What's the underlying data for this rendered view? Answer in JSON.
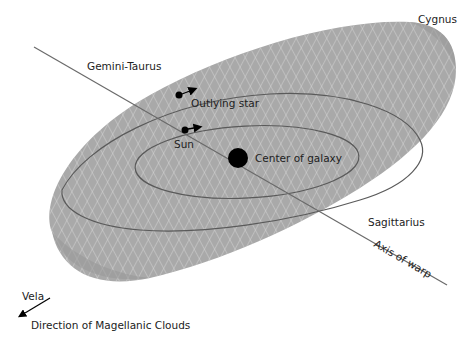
{
  "diagram": {
    "type": "warped galactic disc schematic",
    "colors": {
      "disc_fill": "#a9a9a9",
      "grid_lines": "#d6d6d6",
      "orbit_lines": "#5a5a5a",
      "axis_line": "#6a6a6a",
      "markers": "#000000",
      "text": "#222222"
    },
    "labels": {
      "cygnus": "Cygnus",
      "gemini_taurus": "Gemini-Taurus",
      "outlying_star": "Outlying star",
      "sun": "Sun",
      "center_of_galaxy": "Center of galaxy",
      "sagittarius": "Sagittarius",
      "axis_of_warp": "Axis of warp",
      "vela": "Vela",
      "direction_magellanic": "Direction of Magellanic Clouds"
    },
    "elements": [
      {
        "id": "galactic-disc",
        "shape": "warped ellipse"
      },
      {
        "id": "inner-orbit",
        "passes_through": "Sun"
      },
      {
        "id": "outer-orbit",
        "passes_through": "Outlying star"
      },
      {
        "id": "center-of-galaxy",
        "marker": "large filled circle"
      },
      {
        "id": "sun",
        "marker": "small filled circle with motion arrow"
      },
      {
        "id": "outlying-star",
        "marker": "small filled circle with motion arrow"
      },
      {
        "id": "warp-axis",
        "from": "Gemini-Taurus",
        "to": "Sagittarius"
      },
      {
        "id": "magellanic-direction-arrow",
        "toward": "Vela"
      }
    ]
  }
}
